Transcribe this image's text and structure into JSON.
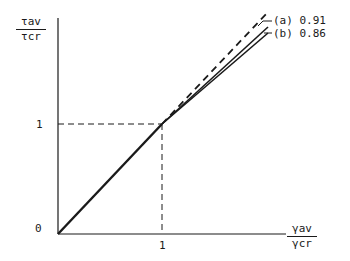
{
  "diagram": {
    "y_axis_label": {
      "numerator": "τav",
      "denominator": "τcr"
    },
    "x_axis_label": {
      "numerator": "γav",
      "denominator": "γcr"
    },
    "origin_label": "0",
    "x_tick_label": "1",
    "y_tick_label": "1",
    "curves": [
      {
        "id": "dashed",
        "style": "dashed",
        "label": ""
      },
      {
        "id": "a",
        "style": "solid",
        "label": "(a) 0.91"
      },
      {
        "id": "b",
        "style": "solid",
        "label": "(b) 0.86"
      }
    ],
    "colors": {
      "ink": "#1a1a1a",
      "background": "#ffffff"
    }
  }
}
